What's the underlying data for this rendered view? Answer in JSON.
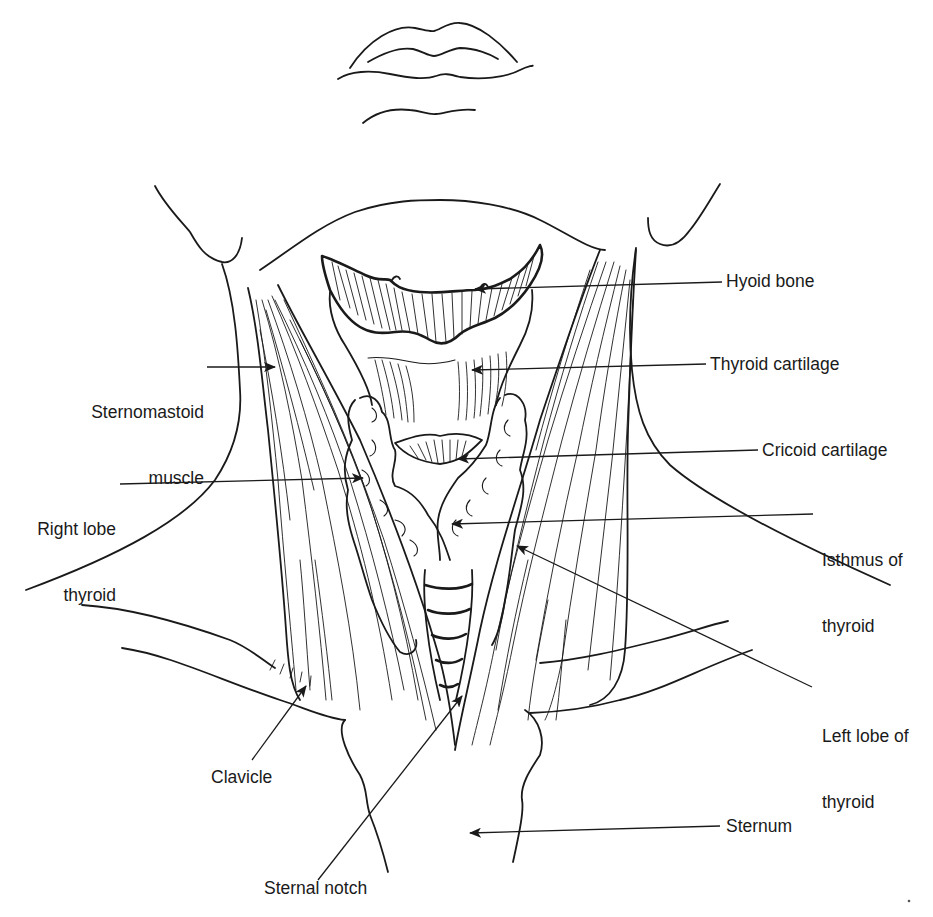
{
  "figure": {
    "ink_color": "#1a1a1a",
    "background_color": "#ffffff"
  },
  "labels": {
    "hyoid_bone": "Hyoid bone",
    "thyroid_cartilage": "Thyroid cartilage",
    "cricoid_cartilage": "Cricoid cartilage",
    "isthmus_line1": "Isthmus of",
    "isthmus_line2": "thyroid",
    "left_lobe_line1": "Left lobe of",
    "left_lobe_line2": "thyroid",
    "sternum": "Sternum",
    "sternal_notch": "Sternal notch",
    "clavicle": "Clavicle",
    "right_lobe_line1": "Right lobe",
    "right_lobe_line2": "thyroid",
    "sternomastoid_line1": "Sternomastoid",
    "sternomastoid_line2": "muscle"
  }
}
